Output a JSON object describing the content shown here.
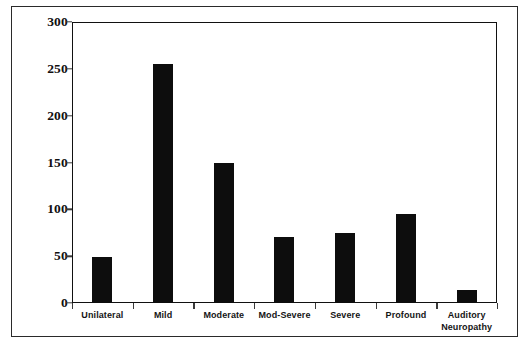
{
  "chart_data": {
    "type": "bar",
    "title": "",
    "subtitle": "",
    "xlabel": "",
    "ylabel": "",
    "categories": [
      "Unilateral",
      "Mild",
      "Moderate",
      "Mod-Severe",
      "Severe",
      "Profound",
      "Auditory\nNeuropathy"
    ],
    "values": [
      49,
      255,
      149,
      71,
      75,
      95,
      14
    ],
    "ylim": [
      0,
      300
    ],
    "yticks": [
      0,
      50,
      100,
      150,
      200,
      250,
      300
    ],
    "ytick_labels": [
      "0",
      "50",
      "100",
      "150",
      "200",
      "250",
      "300"
    ],
    "grid": false,
    "legend": null,
    "legend_position": "none",
    "bar_color": "#0d0d0d",
    "background_color": "#ffffff",
    "axis_color": "#111111",
    "frame_color": "#2a2a2a"
  }
}
